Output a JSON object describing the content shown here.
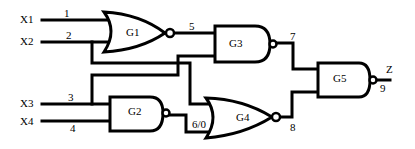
{
  "diagram": {
    "type": "logic-circuit",
    "inputs": [
      {
        "name": "X1",
        "line": "1"
      },
      {
        "name": "X2",
        "line": "2"
      },
      {
        "name": "X3",
        "line": "3"
      },
      {
        "name": "X4",
        "line": "4"
      }
    ],
    "gates": [
      {
        "id": "G1",
        "kind": "NOR",
        "inputs": [
          "1",
          "2"
        ],
        "output": "5"
      },
      {
        "id": "G2",
        "kind": "NAND",
        "inputs": [
          "3",
          "4"
        ],
        "output": "6/0"
      },
      {
        "id": "G3",
        "kind": "NAND",
        "inputs": [
          "5",
          "3"
        ],
        "output": "7"
      },
      {
        "id": "G4",
        "kind": "NOR",
        "inputs": [
          "2",
          "6/0"
        ],
        "output": "8"
      },
      {
        "id": "G5",
        "kind": "NAND",
        "inputs": [
          "7",
          "8"
        ],
        "output": "9"
      }
    ],
    "output": {
      "name": "Z",
      "line": "9"
    },
    "line_labels": {
      "l1": "1",
      "l2": "2",
      "l3": "3",
      "l4": "4",
      "l5": "5",
      "l6": "6/0",
      "l7": "7",
      "l8": "8",
      "l9": "9"
    },
    "input_labels": {
      "x1": "X1",
      "x2": "X2",
      "x3": "X3",
      "x4": "X4"
    },
    "gate_labels": {
      "g1": "G1",
      "g2": "G2",
      "g3": "G3",
      "g4": "G4",
      "g5": "G5"
    },
    "output_label": "Z"
  }
}
